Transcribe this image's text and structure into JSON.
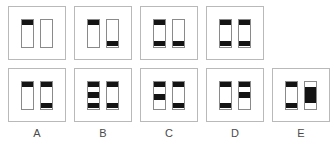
{
  "figure": {
    "type": "visual-analogy-matrix",
    "panel_border_color": "#b9b9b9",
    "bar_border_color": "#8a8a8a",
    "band_color": "#141414",
    "background_color": "#ffffff"
  },
  "rows": [
    {
      "name": "sequence-row",
      "cells": [
        {
          "label": "",
          "has_panel": true,
          "bars": [
            {
              "name": "bar-left",
              "bands": [
                {
                  "top": 0,
                  "height": 22
                }
              ]
            },
            {
              "name": "bar-right",
              "bands": []
            }
          ]
        },
        {
          "label": "",
          "has_panel": true,
          "bars": [
            {
              "name": "bar-left",
              "bands": [
                {
                  "top": 0,
                  "height": 22
                }
              ]
            },
            {
              "name": "bar-right",
              "bands": [
                {
                  "top": 78,
                  "height": 22
                }
              ]
            }
          ]
        },
        {
          "label": "",
          "has_panel": true,
          "bars": [
            {
              "name": "bar-left",
              "bands": [
                {
                  "top": 0,
                  "height": 22
                },
                {
                  "top": 78,
                  "height": 22
                }
              ]
            },
            {
              "name": "bar-right",
              "bands": [
                {
                  "top": 78,
                  "height": 22
                }
              ]
            }
          ]
        },
        {
          "label": "",
          "has_panel": true,
          "bars": [
            {
              "name": "bar-left",
              "bands": [
                {
                  "top": 0,
                  "height": 22
                },
                {
                  "top": 78,
                  "height": 22
                }
              ]
            },
            {
              "name": "bar-right",
              "bands": [
                {
                  "top": 0,
                  "height": 22
                },
                {
                  "top": 78,
                  "height": 22
                }
              ]
            }
          ]
        },
        {
          "label": "",
          "has_panel": false,
          "bars": []
        }
      ]
    },
    {
      "name": "options-row",
      "cells": [
        {
          "label": "A",
          "has_panel": true,
          "bars": [
            {
              "name": "bar-left",
              "bands": [
                {
                  "top": 0,
                  "height": 22
                }
              ]
            },
            {
              "name": "bar-right",
              "bands": [
                {
                  "top": 0,
                  "height": 22
                },
                {
                  "top": 78,
                  "height": 22
                }
              ]
            }
          ]
        },
        {
          "label": "B",
          "has_panel": true,
          "bars": [
            {
              "name": "bar-left",
              "bands": [
                {
                  "top": 0,
                  "height": 22
                },
                {
                  "top": 40,
                  "height": 22
                },
                {
                  "top": 78,
                  "height": 22
                }
              ]
            },
            {
              "name": "bar-right",
              "bands": [
                {
                  "top": 0,
                  "height": 22
                },
                {
                  "top": 78,
                  "height": 22
                }
              ]
            }
          ]
        },
        {
          "label": "C",
          "has_panel": true,
          "bars": [
            {
              "name": "bar-left",
              "bands": [
                {
                  "top": 0,
                  "height": 22
                },
                {
                  "top": 46,
                  "height": 22
                }
              ]
            },
            {
              "name": "bar-right",
              "bands": [
                {
                  "top": 0,
                  "height": 22
                },
                {
                  "top": 78,
                  "height": 22
                }
              ]
            }
          ]
        },
        {
          "label": "D",
          "has_panel": true,
          "bars": [
            {
              "name": "bar-left",
              "bands": [
                {
                  "top": 0,
                  "height": 22
                },
                {
                  "top": 78,
                  "height": 22
                }
              ]
            },
            {
              "name": "bar-right",
              "bands": [
                {
                  "top": 0,
                  "height": 22
                },
                {
                  "top": 40,
                  "height": 22
                }
              ]
            }
          ]
        },
        {
          "label": "E",
          "has_panel": true,
          "bars": [
            {
              "name": "bar-left",
              "bands": [
                {
                  "top": 0,
                  "height": 22
                },
                {
                  "top": 78,
                  "height": 22
                }
              ]
            },
            {
              "name": "bar-right",
              "bands": [
                {
                  "top": 22,
                  "height": 56
                }
              ]
            }
          ]
        }
      ]
    }
  ]
}
